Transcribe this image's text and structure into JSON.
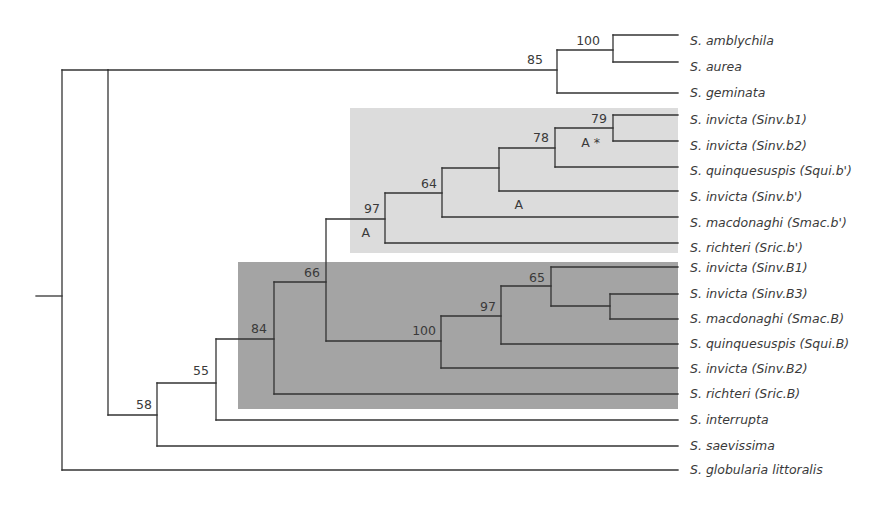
{
  "title": "",
  "colors": {
    "background": "#ffffff",
    "branch": "#333333",
    "text": "#3a3a3a",
    "clade_light": "#dcdcdc",
    "clade_dark": "#a4a4a4"
  },
  "highlight_boxes": [
    {
      "name": "clade-b-prime",
      "x": 350,
      "y": 108,
      "w": 328,
      "h": 145,
      "color": "#dcdcdc"
    },
    {
      "name": "clade-B",
      "x": 238,
      "y": 262,
      "w": 440,
      "h": 147,
      "color": "#a4a4a4"
    }
  ],
  "leaves": [
    {
      "label": "S. amblychila",
      "y": 41
    },
    {
      "label": "S. aurea",
      "y": 67
    },
    {
      "label": "S. geminata",
      "y": 93
    },
    {
      "label": "S. invicta (Sinv.b1)",
      "y": 120
    },
    {
      "label": "S. invicta (Sinv.b2)",
      "y": 146
    },
    {
      "label": "S. quinquesuspis (Squi.b')",
      "y": 171
    },
    {
      "label": "S. invicta (Sinv.b')",
      "y": 197
    },
    {
      "label": "S. macdonaghi (Smac.b')",
      "y": 223
    },
    {
      "label": "S. richteri (Sric.b')",
      "y": 248
    },
    {
      "label": "S. invicta (Sinv.B1)",
      "y": 268
    },
    {
      "label": "S. invicta (Sinv.B3)",
      "y": 294
    },
    {
      "label": "S. macdonaghi (Smac.B)",
      "y": 319
    },
    {
      "label": "S. quinquesuspis (Squi.B)",
      "y": 344
    },
    {
      "label": "S. invicta (Sinv.B2)",
      "y": 369
    },
    {
      "label": "S. richteri (Sric.B)",
      "y": 394
    },
    {
      "label": "S. interrupta",
      "y": 420
    },
    {
      "label": "S. saevissima",
      "y": 446
    },
    {
      "label": "S. globularia littoralis",
      "y": 470
    }
  ],
  "leaf_x": 678,
  "label_x": 690,
  "segments": [
    [
      36,
      296,
      62,
      296
    ],
    [
      62,
      70,
      62,
      470
    ],
    [
      62,
      470,
      678,
      470
    ],
    [
      62,
      70,
      108,
      70
    ],
    [
      108,
      70,
      108,
      415
    ],
    [
      108,
      70,
      557,
      70
    ],
    [
      557,
      50,
      557,
      93
    ],
    [
      557,
      50,
      613,
      50
    ],
    [
      613,
      35,
      613,
      62
    ],
    [
      613,
      35,
      678,
      35
    ],
    [
      613,
      62,
      678,
      62
    ],
    [
      557,
      93,
      678,
      93
    ],
    [
      108,
      415,
      157,
      415
    ],
    [
      157,
      383,
      157,
      446
    ],
    [
      157,
      446,
      678,
      446
    ],
    [
      157,
      383,
      216,
      383
    ],
    [
      216,
      339,
      216,
      420
    ],
    [
      216,
      420,
      678,
      420
    ],
    [
      216,
      339,
      274,
      339
    ],
    [
      274,
      282,
      274,
      394
    ],
    [
      274,
      394,
      678,
      394
    ],
    [
      274,
      282,
      326,
      282
    ],
    [
      326,
      219,
      326,
      341
    ],
    [
      326,
      219,
      385,
      219
    ],
    [
      385,
      193,
      385,
      243
    ],
    [
      385,
      243,
      678,
      243
    ],
    [
      385,
      193,
      442,
      193
    ],
    [
      442,
      168,
      442,
      217
    ],
    [
      442,
      217,
      678,
      217
    ],
    [
      442,
      168,
      499,
      168
    ],
    [
      499,
      148,
      499,
      191
    ],
    [
      499,
      191,
      678,
      191
    ],
    [
      499,
      148,
      555,
      148
    ],
    [
      555,
      128,
      555,
      167
    ],
    [
      555,
      167,
      678,
      167
    ],
    [
      555,
      128,
      613,
      128
    ],
    [
      613,
      115,
      613,
      141
    ],
    [
      613,
      115,
      678,
      115
    ],
    [
      613,
      141,
      678,
      141
    ],
    [
      326,
      341,
      441,
      341
    ],
    [
      441,
      316,
      441,
      368
    ],
    [
      441,
      368,
      678,
      368
    ],
    [
      441,
      316,
      501,
      316
    ],
    [
      501,
      286,
      501,
      344
    ],
    [
      501,
      344,
      678,
      344
    ],
    [
      501,
      286,
      551,
      286
    ],
    [
      551,
      267,
      551,
      306
    ],
    [
      551,
      267,
      678,
      267
    ],
    [
      551,
      306,
      610,
      306
    ],
    [
      610,
      294,
      610,
      319
    ],
    [
      610,
      294,
      678,
      294
    ],
    [
      610,
      319,
      678,
      319
    ]
  ],
  "support_labels": [
    {
      "text": "85",
      "x": 543,
      "y": 64
    },
    {
      "text": "100",
      "x": 600,
      "y": 45
    },
    {
      "text": "58",
      "x": 152,
      "y": 409
    },
    {
      "text": "55",
      "x": 209,
      "y": 375
    },
    {
      "text": "84",
      "x": 267,
      "y": 333
    },
    {
      "text": "66",
      "x": 320,
      "y": 277
    },
    {
      "text": "97",
      "x": 380,
      "y": 213
    },
    {
      "text": "A",
      "x": 370,
      "y": 237
    },
    {
      "text": "64",
      "x": 437,
      "y": 188
    },
    {
      "text": "A",
      "x": 523,
      "y": 209
    },
    {
      "text": "78",
      "x": 549,
      "y": 142
    },
    {
      "text": "79",
      "x": 607,
      "y": 123
    },
    {
      "text": "A *",
      "x": 600,
      "y": 147
    },
    {
      "text": "100",
      "x": 436,
      "y": 335
    },
    {
      "text": "97",
      "x": 496,
      "y": 311
    },
    {
      "text": "65",
      "x": 545,
      "y": 282
    }
  ]
}
